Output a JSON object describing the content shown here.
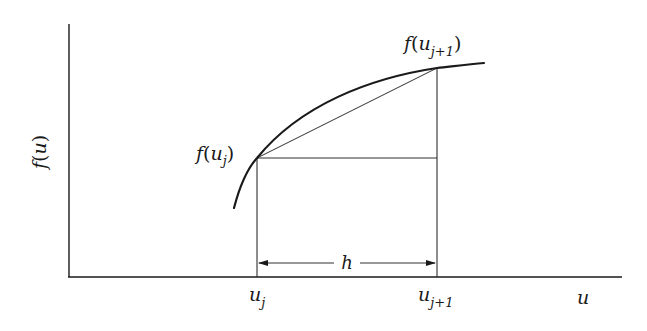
{
  "figure": {
    "axes": {
      "x_label": "u",
      "y_label": "f(u)",
      "y_label_func": "f",
      "y_label_var": "u"
    },
    "points": {
      "left": {
        "label_func": "f",
        "label_var": "u",
        "label_sub": "j",
        "x_tick_var": "u",
        "x_tick_sub": "j"
      },
      "right": {
        "label_func": "f",
        "label_var": "u",
        "label_sub": "j+1",
        "x_tick_var": "u",
        "x_tick_sub": "j+1"
      }
    },
    "interval": {
      "label": "h"
    },
    "colors": {
      "line": "#1a1a1a",
      "background": "#ffffff"
    }
  }
}
